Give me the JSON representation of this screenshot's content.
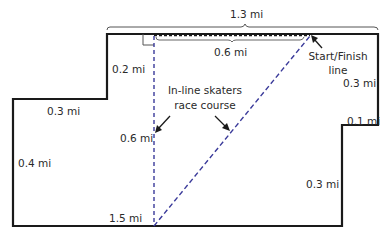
{
  "diagram": {
    "title_dimension": "1.3 mi",
    "segments": {
      "top_inner": "0.6 mi",
      "upper_left_vertical": "0.2 mi",
      "left_step_horizontal": "0.3 mi",
      "left_vertical": "0.4 mi",
      "course_vertical": "0.6 mi",
      "bottom": "1.5 mi",
      "right_upper_vertical": "0.3 mi",
      "right_step_horizontal": "0.1 mi",
      "right_lower_vertical": "0.3 mi"
    },
    "annotations": {
      "course_label_line1": "In-line skaters",
      "course_label_line2": "race course",
      "start_finish_line1": "Start/Finish",
      "start_finish_line2": "line"
    },
    "colors": {
      "outline": "#1a1a1a",
      "course_dash": "#3a3a9a",
      "text": "#2a2a2a",
      "brace": "#555555"
    }
  }
}
